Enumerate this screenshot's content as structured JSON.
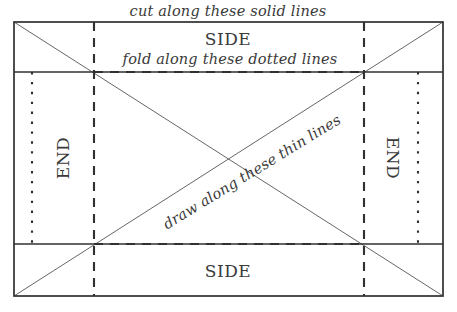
{
  "diagram": {
    "canvas": {
      "width": 457,
      "height": 312,
      "background": "#ffffff"
    },
    "stroke_colors": {
      "solid_cut": "#303030",
      "dashed_fold": "#303030",
      "dotted_fold": "#303030",
      "thin_draw": "#555555"
    },
    "panels": {
      "side_top_label": "SIDE",
      "side_bottom_label": "SIDE",
      "end_left_label": "END",
      "end_right_label": "END"
    },
    "captions": {
      "cut": "cut along these solid lines",
      "fold": "fold along these dotted lines",
      "draw": "draw along these thin lines"
    },
    "geometry": {
      "outer_rect": {
        "x1": 14,
        "y1": 22,
        "x2": 443,
        "y2": 296
      },
      "solid_horizontal_lines_y": [
        72,
        244
      ],
      "dashed_vertical_lines_x": [
        94,
        364
      ],
      "dashed_horizontal_lines_y": [
        72,
        244
      ],
      "dotted_vertical_lines_x": [
        32,
        418
      ],
      "dotted_span_y": [
        72,
        244
      ],
      "diagonals": [
        {
          "x1": 14,
          "y1": 22,
          "x2": 443,
          "y2": 296
        },
        {
          "x1": 443,
          "y1": 22,
          "x2": 14,
          "y2": 296
        }
      ]
    }
  }
}
